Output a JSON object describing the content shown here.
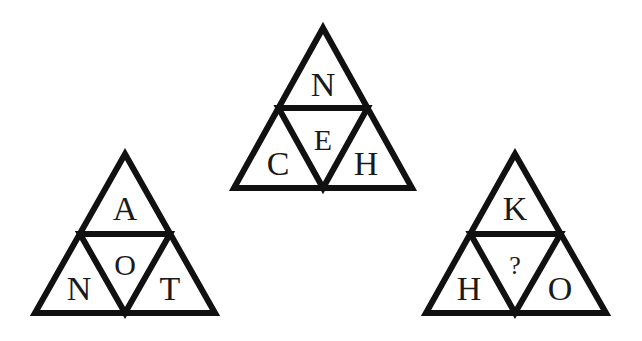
{
  "puzzle": {
    "triangles": [
      {
        "id": "top",
        "top": "N",
        "center": "E",
        "left": "C",
        "right": "H"
      },
      {
        "id": "left",
        "top": "A",
        "center": "O",
        "left": "N",
        "right": "T"
      },
      {
        "id": "right",
        "top": "K",
        "center": "?",
        "left": "H",
        "right": "O"
      }
    ],
    "line_color": "#111111",
    "background_color": "#ffffff"
  }
}
